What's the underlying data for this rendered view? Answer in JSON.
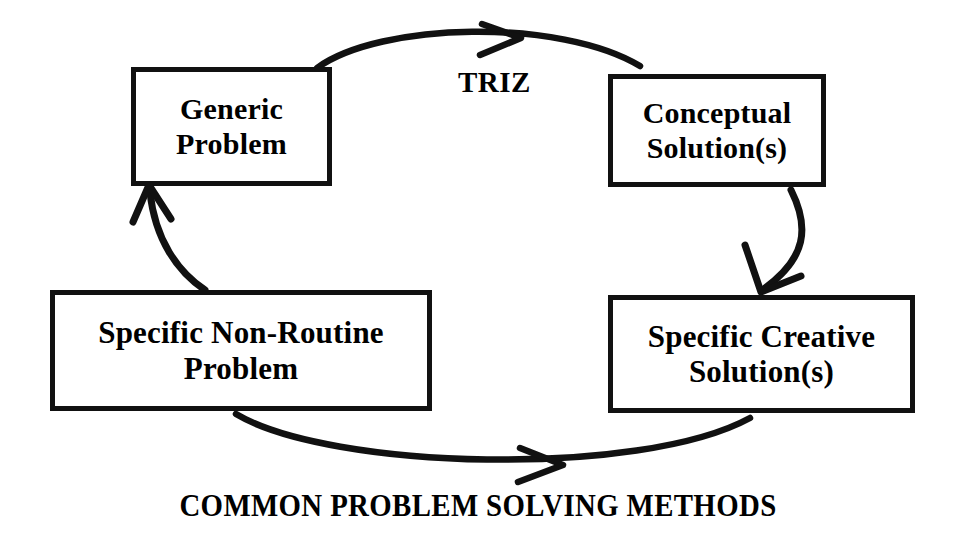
{
  "diagram": {
    "caption": "COMMON PROBLEM SOLVING METHODS",
    "stroke_color": "#111111",
    "background_color": "#ffffff",
    "nodes": [
      {
        "id": "generic-problem",
        "line1": "Generic",
        "line2": "Problem"
      },
      {
        "id": "conceptual-solution",
        "line1": "Conceptual",
        "line2": "Solution(s)"
      },
      {
        "id": "specific-problem",
        "line1": "Specific Non-Routine",
        "line2": "Problem"
      },
      {
        "id": "specific-solution",
        "line1": "Specific Creative",
        "line2": "Solution(s)"
      }
    ],
    "edges": [
      {
        "id": "top-arrow",
        "label": "TRIZ",
        "from": "generic-problem",
        "to": "conceptual-solution"
      },
      {
        "id": "right-arrow",
        "label": "",
        "from": "conceptual-solution",
        "to": "specific-solution"
      },
      {
        "id": "bottom-arrow",
        "label": "COMMON PROBLEM SOLVING METHODS",
        "from": "specific-problem",
        "to": "specific-solution"
      },
      {
        "id": "left-arrow",
        "label": "",
        "from": "specific-problem",
        "to": "generic-problem"
      }
    ]
  }
}
